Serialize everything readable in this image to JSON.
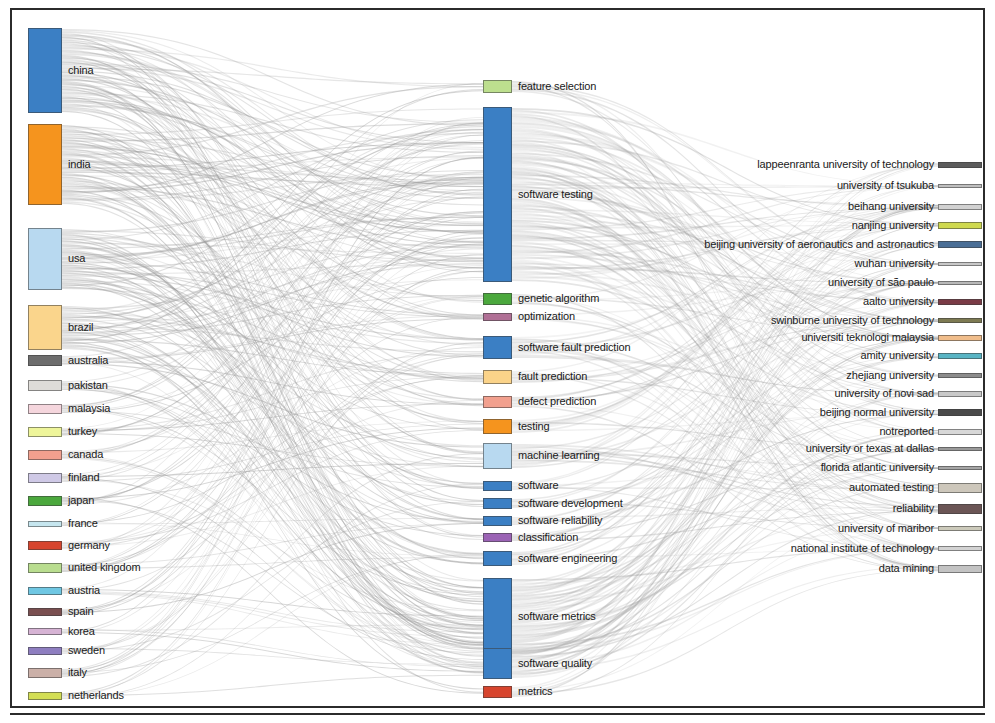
{
  "chart_data": {
    "type": "sankey",
    "title": "",
    "columns": [
      "country",
      "keyword",
      "institution"
    ],
    "legend": null,
    "grid": false,
    "nodes": {
      "country": [
        {
          "label": "china",
          "color": "#3b7fc4",
          "y": 28,
          "height": 85,
          "value": 85
        },
        {
          "label": "india",
          "color": "#f5941e",
          "y": 124,
          "height": 81,
          "value": 81
        },
        {
          "label": "usa",
          "color": "#b8d9f0",
          "y": 228,
          "height": 62,
          "value": 62
        },
        {
          "label": "brazil",
          "color": "#fad58c",
          "y": 305,
          "height": 45,
          "value": 45
        },
        {
          "label": "australia",
          "color": "#6d6d6d",
          "y": 355,
          "height": 11,
          "value": 11
        },
        {
          "label": "pakistan",
          "color": "#dedcd8",
          "y": 380,
          "height": 11,
          "value": 11
        },
        {
          "label": "malaysia",
          "color": "#f5d6dd",
          "y": 404,
          "height": 10,
          "value": 10
        },
        {
          "label": "turkey",
          "color": "#eef59a",
          "y": 427,
          "height": 10,
          "value": 10
        },
        {
          "label": "canada",
          "color": "#f2a08e",
          "y": 450,
          "height": 10,
          "value": 10
        },
        {
          "label": "finland",
          "color": "#cfc9e6",
          "y": 473,
          "height": 10,
          "value": 10
        },
        {
          "label": "japan",
          "color": "#4ba83d",
          "y": 496,
          "height": 10,
          "value": 10
        },
        {
          "label": "france",
          "color": "#c6e6ef",
          "y": 521,
          "height": 6,
          "value": 6
        },
        {
          "label": "germany",
          "color": "#d7452e",
          "y": 541,
          "height": 9,
          "value": 9
        },
        {
          "label": "united kingdom",
          "color": "#b9dd8f",
          "y": 563,
          "height": 10,
          "value": 10
        },
        {
          "label": "austria",
          "color": "#6fc7e3",
          "y": 587,
          "height": 8,
          "value": 8
        },
        {
          "label": "spain",
          "color": "#7a4f50",
          "y": 608,
          "height": 8,
          "value": 8
        },
        {
          "label": "korea",
          "color": "#d6b3d4",
          "y": 628,
          "height": 7,
          "value": 7
        },
        {
          "label": "sweden",
          "color": "#8e7ec0",
          "y": 647,
          "height": 8,
          "value": 8
        },
        {
          "label": "italy",
          "color": "#cbb0a8",
          "y": 668,
          "height": 10,
          "value": 10
        },
        {
          "label": "netherlands",
          "color": "#d3de54",
          "y": 692,
          "height": 8,
          "value": 8
        }
      ],
      "keyword": [
        {
          "label": "feature selection",
          "color": "#bddf8e",
          "y": 80,
          "height": 13,
          "value": 13
        },
        {
          "label": "software testing",
          "color": "#3b7fc4",
          "y": 107,
          "height": 175,
          "value": 175
        },
        {
          "label": "genetic algorithm",
          "color": "#4ba83d",
          "y": 293,
          "height": 12,
          "value": 12
        },
        {
          "label": "optimization",
          "color": "#b06f95",
          "y": 313,
          "height": 8,
          "value": 8
        },
        {
          "label": "software fault prediction",
          "color": "#3b7fc4",
          "y": 336,
          "height": 23,
          "value": 23
        },
        {
          "label": "fault prediction",
          "color": "#fbd389",
          "y": 370,
          "height": 14,
          "value": 14
        },
        {
          "label": "defect prediction",
          "color": "#f2a08e",
          "y": 396,
          "height": 12,
          "value": 12
        },
        {
          "label": "testing",
          "color": "#f5941e",
          "y": 419,
          "height": 15,
          "value": 15
        },
        {
          "label": "machine learning",
          "color": "#b8d9f0",
          "y": 443,
          "height": 26,
          "value": 26
        },
        {
          "label": "software",
          "color": "#3b7fc4",
          "y": 481,
          "height": 10,
          "value": 10
        },
        {
          "label": "software development",
          "color": "#3b7fc4",
          "y": 498,
          "height": 11,
          "value": 11
        },
        {
          "label": "software reliability",
          "color": "#3b7fc4",
          "y": 516,
          "height": 10,
          "value": 10
        },
        {
          "label": "classification",
          "color": "#9b63b5",
          "y": 533,
          "height": 9,
          "value": 9
        },
        {
          "label": "software engineering",
          "color": "#3b7fc4",
          "y": 551,
          "height": 15,
          "value": 15
        },
        {
          "label": "software metrics",
          "color": "#3b7fc4",
          "y": 578,
          "height": 77,
          "value": 77
        },
        {
          "label": "software quality",
          "color": "#3b7fc4",
          "y": 648,
          "height": 31,
          "value": 31
        },
        {
          "label": "metrics",
          "color": "#d7452e",
          "y": 686,
          "height": 12,
          "value": 12
        }
      ],
      "institution": [
        {
          "label": "lappeenranta university of technology",
          "color": "#5c5c5c",
          "y": 162,
          "height": 6,
          "value": 6
        },
        {
          "label": "university of tsukuba",
          "color": "#bfbfbf",
          "y": 184,
          "height": 4,
          "value": 4
        },
        {
          "label": "beihang university",
          "color": "#d2d2d2",
          "y": 204,
          "height": 6,
          "value": 6
        },
        {
          "label": "nanjing university",
          "color": "#cfd94f",
          "y": 222,
          "height": 7,
          "value": 7
        },
        {
          "label": "beijing university of aeronautics and astronautics",
          "color": "#4a6e96",
          "y": 241,
          "height": 7,
          "value": 7
        },
        {
          "label": "wuhan university",
          "color": "#c8c8c8",
          "y": 262,
          "height": 4,
          "value": 4
        },
        {
          "label": "university of s&#227;o paulo",
          "color": "#b8b8b8",
          "y": 281,
          "height": 4,
          "value": 4
        },
        {
          "label": "aalto university",
          "color": "#7a3b46",
          "y": 299,
          "height": 6,
          "value": 6
        },
        {
          "label": "swinburne university of technology",
          "color": "#7d7a52",
          "y": 318,
          "height": 5,
          "value": 5
        },
        {
          "label": "universiti teknologi malaysia",
          "color": "#f0bd8b",
          "y": 335,
          "height": 6,
          "value": 6
        },
        {
          "label": "amity university",
          "color": "#58b4c4",
          "y": 353,
          "height": 6,
          "value": 6
        },
        {
          "label": "zhejiang university",
          "color": "#8c8c8c",
          "y": 373,
          "height": 5,
          "value": 5
        },
        {
          "label": "university of novi sad",
          "color": "#c9c9c9",
          "y": 391,
          "height": 6,
          "value": 6
        },
        {
          "label": "beijing normal university",
          "color": "#4a4a4a",
          "y": 409,
          "height": 7,
          "value": 7
        },
        {
          "label": "notreported",
          "color": "#d8d8d8",
          "y": 429,
          "height": 6,
          "value": 6
        },
        {
          "label": "university or texas at dallas",
          "color": "#9a9a9a",
          "y": 447,
          "height": 4,
          "value": 4
        },
        {
          "label": "florida atlantic university",
          "color": "#a6a6a6",
          "y": 466,
          "height": 4,
          "value": 4
        },
        {
          "label": "automated testing",
          "color": "#cdc7bb",
          "y": 483,
          "height": 10,
          "value": 10
        },
        {
          "label": "reliability",
          "color": "#6b5555",
          "y": 504,
          "height": 10,
          "value": 10
        },
        {
          "label": "university of maribor",
          "color": "#cccabb",
          "y": 526,
          "height": 5,
          "value": 5
        },
        {
          "label": "national institute of technology",
          "color": "#d3d3d3",
          "y": 546,
          "height": 5,
          "value": 5
        },
        {
          "label": "data mining",
          "color": "#c3c3c3",
          "y": 565,
          "height": 8,
          "value": 8
        }
      ]
    },
    "link_color": "#9a9a9a",
    "link_opacity": 0.35,
    "layout": {
      "country_node_x": 28,
      "country_node_width": 34,
      "keyword_node_x": 483,
      "keyword_node_width": 29,
      "institution_node_x": 938,
      "institution_node_width": 44
    }
  }
}
